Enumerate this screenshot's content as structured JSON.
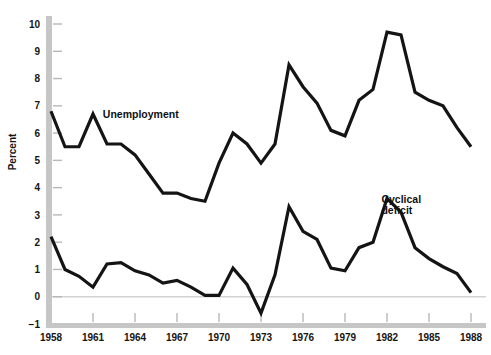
{
  "chart_data": {
    "type": "line",
    "title": "",
    "xlabel": "",
    "ylabel": "Percent",
    "xlim": [
      1958,
      1988
    ],
    "ylim": [
      -1,
      10
    ],
    "yticks": [
      -1,
      0,
      1,
      2,
      3,
      4,
      5,
      6,
      7,
      8,
      9,
      10
    ],
    "ytick_labels": [
      "−1",
      "0",
      "1",
      "2",
      "3",
      "4",
      "5",
      "6",
      "7",
      "8",
      "9",
      "10"
    ],
    "xticks": [
      1958,
      1961,
      1964,
      1967,
      1970,
      1973,
      1976,
      1979,
      1982,
      1985,
      1988
    ],
    "xtick_labels": [
      "1958",
      "1961",
      "1964",
      "1967",
      "1970",
      "1973",
      "1976",
      "1979",
      "1982",
      "1985",
      "1988"
    ],
    "grid": false,
    "zero_line": true,
    "legend": "inline-annotations",
    "x": [
      1958,
      1959,
      1960,
      1961,
      1962,
      1963,
      1964,
      1965,
      1966,
      1967,
      1968,
      1969,
      1970,
      1971,
      1972,
      1973,
      1974,
      1975,
      1976,
      1977,
      1978,
      1979,
      1980,
      1981,
      1982,
      1983,
      1984,
      1985,
      1986,
      1987,
      1988
    ],
    "series": [
      {
        "name": "Unemployment",
        "color": "#141414",
        "label_x": 1961.7,
        "label_y": 6.55,
        "values": [
          6.8,
          5.5,
          5.5,
          6.7,
          5.6,
          5.6,
          5.2,
          4.5,
          3.8,
          3.8,
          3.6,
          3.5,
          4.9,
          6.0,
          5.6,
          4.9,
          5.6,
          8.5,
          7.7,
          7.1,
          6.1,
          5.9,
          7.2,
          7.6,
          9.7,
          9.6,
          7.5,
          7.2,
          7.0,
          6.2,
          5.5
        ],
        "notes": "Unemployment rate, percent"
      },
      {
        "name": "Cyclical deficit",
        "color": "#141414",
        "label_x": 1981.6,
        "label_y": 3.45,
        "label_lines": [
          "Cyclical",
          "deficit"
        ],
        "values": [
          2.2,
          1.0,
          0.75,
          0.35,
          1.2,
          1.25,
          0.95,
          0.8,
          0.5,
          0.6,
          0.35,
          0.05,
          0.05,
          1.05,
          0.45,
          -0.6,
          0.8,
          3.3,
          2.4,
          2.1,
          1.05,
          0.95,
          1.8,
          2.0,
          3.6,
          3.1,
          1.8,
          1.4,
          1.1,
          0.85,
          0.15
        ],
        "notes": "Cyclical deficit as percent of GNP"
      }
    ]
  },
  "axis": {
    "y_axis_title": "Percent"
  }
}
